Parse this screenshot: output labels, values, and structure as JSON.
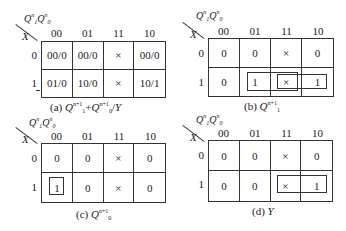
{
  "figure": {
    "column_values": [
      "00",
      "01",
      "11",
      "10"
    ],
    "row_values": [
      "0",
      "1"
    ],
    "column_variables": "Q1nQ0n",
    "row_variable": "X"
  },
  "panels": {
    "a": {
      "caption_prefix": "(a)",
      "caption_main": "Q",
      "caption_text": "Q1^(n+1) Q0^(n+1) / Y",
      "cells": [
        [
          "00/0",
          "00/0",
          "×",
          "00/0"
        ],
        [
          "01/0",
          "10/0",
          "×",
          "10/1"
        ]
      ]
    },
    "b": {
      "caption_prefix": "(b)",
      "caption_text": "Q1^(n+1)",
      "cells": [
        [
          "0",
          "0",
          "×",
          "0"
        ],
        [
          "0",
          "1",
          "×",
          "1"
        ]
      ],
      "groupings": [
        "X·Q0 (cells 1-01,1-11)",
        "X·Q1 (cells 1-11,1-10)"
      ]
    },
    "c": {
      "caption_prefix": "(c)",
      "caption_text": "Q0^(n+1)",
      "cells": [
        [
          "0",
          "0",
          "×",
          "0"
        ],
        [
          "1",
          "0",
          "×",
          "0"
        ]
      ],
      "groupings": [
        "X·Q1'·Q0' (cell 1-00)"
      ]
    },
    "d": {
      "caption_prefix": "(d)",
      "caption_text": "Y",
      "cells": [
        [
          "0",
          "0",
          "×",
          "0"
        ],
        [
          "0",
          "0",
          "×",
          "1"
        ]
      ],
      "groupings": [
        "X·Q1 (cells 1-11,1-10)"
      ]
    }
  },
  "labels": {
    "Q": "Q",
    "n": "n",
    "np1": "n+1",
    "one": "1",
    "zero": "0",
    "plus": "+",
    "slash": "/",
    "Y": "Y",
    "X": "X"
  }
}
